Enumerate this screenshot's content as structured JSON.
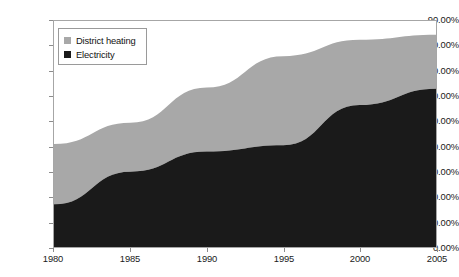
{
  "legend": {
    "position": "inside-top-left",
    "entries": [
      {
        "label": "District heating",
        "color": "#a8a8a8",
        "marker": "filled-square"
      },
      {
        "label": "Electricity",
        "color": "#1a1a1a",
        "marker": "filled-square"
      }
    ]
  },
  "yaxis": {
    "ticks": [
      {
        "value": 90,
        "label": "90.00%"
      },
      {
        "value": 80,
        "label": "80.00%"
      },
      {
        "value": 70,
        "label": "70.00%"
      },
      {
        "value": 60,
        "label": "60.00%"
      },
      {
        "value": 50,
        "label": "50.00%"
      },
      {
        "value": 40,
        "label": "40.00%"
      },
      {
        "value": 30,
        "label": "30.00%"
      },
      {
        "value": 20,
        "label": "20.00%"
      },
      {
        "value": 10,
        "label": "10.00%"
      },
      {
        "value": 0,
        "label": "0.00%"
      }
    ]
  },
  "xaxis": {
    "ticks": [
      {
        "value": 1980,
        "label": "1980"
      },
      {
        "value": 1985,
        "label": "1985"
      },
      {
        "value": 1990,
        "label": "1990"
      },
      {
        "value": 1995,
        "label": "1995"
      },
      {
        "value": 2000,
        "label": "2000"
      },
      {
        "value": 2005,
        "label": "2005"
      }
    ]
  },
  "chart_data": {
    "type": "area",
    "stacked": true,
    "title": "",
    "subtitle": "",
    "xlabel": "",
    "ylabel": "",
    "x": [
      1980,
      1985,
      1990,
      1995,
      2000,
      2005
    ],
    "xtick_labels": [
      "1980",
      "1985",
      "1990",
      "1995",
      "2000",
      "2005"
    ],
    "ytick_labels": [
      "0.00%",
      "10.00%",
      "20.00%",
      "30.00%",
      "40.00%",
      "50.00%",
      "60.00%",
      "70.00%",
      "80.00%",
      "90.00%"
    ],
    "xlim": [
      1980,
      2005
    ],
    "ylim": [
      0,
      90
    ],
    "yunit": "percent",
    "grid": false,
    "legend_position": "upper left (inside plot)",
    "series": [
      {
        "name": "Electricity",
        "color": "#1a1a1a",
        "values": [
          17.0,
          30.0,
          38.0,
          40.5,
          56.5,
          63.0
        ]
      },
      {
        "name": "District heating",
        "color": "#a8a8a8",
        "values": [
          24.0,
          19.5,
          25.5,
          35.5,
          26.0,
          21.5
        ]
      }
    ],
    "cumulative_top": [
      41.0,
      49.5,
      63.5,
      76.0,
      82.5,
      84.5
    ],
    "annotations": []
  }
}
